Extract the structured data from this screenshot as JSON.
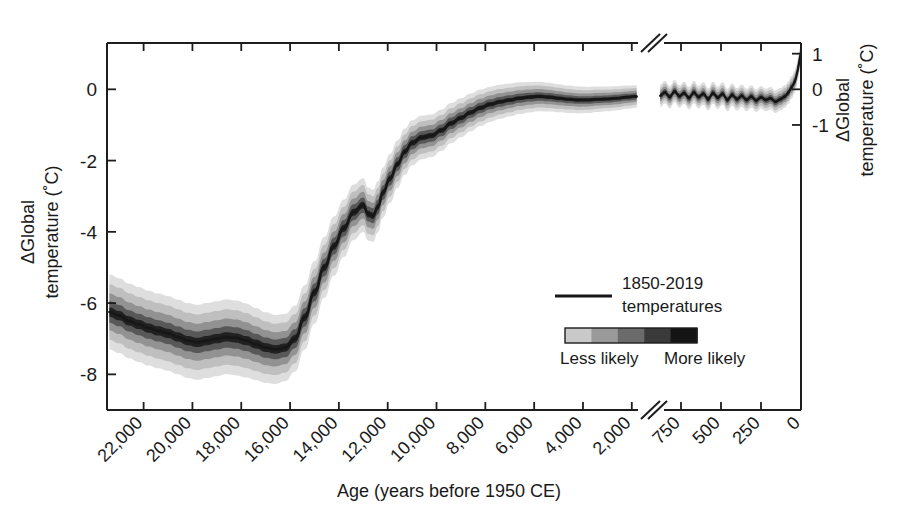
{
  "figure": {
    "type": "paleoclimate-temperature-reconstruction",
    "background": "#ffffff"
  },
  "axes": {
    "x": {
      "title": "Age (years before 1950 CE)",
      "tick_labels_paleo": [
        "22,000",
        "20,000",
        "18,000",
        "16,000",
        "14,000",
        "12,000",
        "10,000",
        "8,000",
        "6,000",
        "4,000",
        "2,000"
      ],
      "tick_values_paleo": [
        22000,
        20000,
        18000,
        16000,
        14000,
        12000,
        10000,
        8000,
        6000,
        4000,
        2000
      ],
      "tick_labels_instrumental": [
        "750",
        "500",
        "250",
        "0"
      ],
      "tick_values_instrumental": [
        750,
        500,
        250,
        0
      ],
      "label_rotation_deg": -45,
      "has_axis_break": true,
      "break_note": "double-slash break between 2,000 and 750 years BP",
      "range_paleo": [
        23500,
        1500
      ],
      "range_instrumental": [
        900,
        0
      ]
    },
    "y_left": {
      "title_line1": "ΔGlobal",
      "title_line2": "temperature (˚C)",
      "tick_labels": [
        "0",
        "-2",
        "-4",
        "-6",
        "-8"
      ],
      "tick_values": [
        0,
        -2,
        -4,
        -6,
        -8
      ],
      "ylim": [
        -9.0,
        1.3
      ]
    },
    "y_right": {
      "title_line1": "ΔGlobal",
      "title_line2": "temperature (˚C)",
      "tick_labels": [
        "1",
        "0",
        "-1"
      ],
      "tick_values": [
        1,
        0,
        -1
      ]
    }
  },
  "legend": {
    "line_label_line1": "1850-2019",
    "line_label_line2": "temperatures",
    "colorbar_left_label": "Less likely",
    "colorbar_right_label": "More likely",
    "colorbar_steps": [
      "#c9c9c9",
      "#9a9a9a",
      "#6b6b6b",
      "#3a3a3a",
      "#141414"
    ]
  },
  "colors": {
    "line": "#171717",
    "band_light": "#d8d8d8",
    "band_mid": "#a8a8a8",
    "band_dark": "#6e6e6e",
    "band_core": "#2e2e2e",
    "axis": "#1d1d1d"
  },
  "chart_data": {
    "type": "line",
    "title": "",
    "xlabel": "Age (years before 1950 CE)",
    "ylabel": "ΔGlobal temperature (˚C)",
    "ylim": [
      -9.0,
      1.3
    ],
    "xlim_paleo": [
      23500,
      1500
    ],
    "xlim_instrumental": [
      900,
      0
    ],
    "grid": false,
    "legend_position": "inside-lower-right",
    "x_axis_reversed": true,
    "series": [
      {
        "name": "Paleoclimate reconstruction (median)",
        "x_units": "years before 1950 CE",
        "x": [
          23400,
          23000,
          22600,
          22200,
          21800,
          21400,
          21000,
          20600,
          20200,
          19800,
          19400,
          19000,
          18600,
          18200,
          17800,
          17400,
          17000,
          16600,
          16200,
          15800,
          15400,
          15000,
          14600,
          14200,
          13800,
          13400,
          13000,
          12800,
          12600,
          12400,
          12200,
          11900,
          11600,
          11300,
          11000,
          10600,
          10200,
          9800,
          9400,
          9000,
          8600,
          8200,
          7800,
          7400,
          7000,
          6600,
          6200,
          5800,
          5400,
          5000,
          4600,
          4200,
          3800,
          3400,
          3000,
          2600,
          2200,
          1800
        ],
        "values": [
          -6.25,
          -6.35,
          -6.5,
          -6.6,
          -6.7,
          -6.78,
          -6.85,
          -6.95,
          -7.05,
          -7.1,
          -7.05,
          -7.0,
          -6.95,
          -6.98,
          -7.05,
          -7.15,
          -7.25,
          -7.3,
          -7.25,
          -7.0,
          -6.4,
          -5.7,
          -5.0,
          -4.4,
          -3.9,
          -3.45,
          -3.25,
          -3.5,
          -3.55,
          -3.3,
          -2.9,
          -2.5,
          -2.1,
          -1.75,
          -1.5,
          -1.35,
          -1.3,
          -1.15,
          -0.95,
          -0.8,
          -0.65,
          -0.52,
          -0.42,
          -0.35,
          -0.3,
          -0.25,
          -0.22,
          -0.2,
          -0.22,
          -0.25,
          -0.28,
          -0.3,
          -0.3,
          -0.28,
          -0.27,
          -0.25,
          -0.22,
          -0.2
        ]
      },
      {
        "name": "1850-2019 temperatures",
        "x_units": "years before 1950 CE",
        "x": [
          880,
          850,
          820,
          790,
          760,
          730,
          700,
          670,
          640,
          610,
          580,
          550,
          520,
          490,
          460,
          430,
          400,
          370,
          340,
          310,
          280,
          250,
          220,
          190,
          160,
          130,
          100,
          80,
          60,
          40,
          30,
          20,
          10,
          0
        ],
        "values": [
          -0.18,
          -0.08,
          -0.22,
          -0.05,
          -0.2,
          -0.1,
          -0.25,
          -0.08,
          -0.22,
          -0.12,
          -0.28,
          -0.1,
          -0.24,
          -0.12,
          -0.3,
          -0.15,
          -0.28,
          -0.18,
          -0.3,
          -0.2,
          -0.32,
          -0.22,
          -0.3,
          -0.25,
          -0.35,
          -0.28,
          -0.2,
          -0.1,
          0.05,
          0.2,
          0.35,
          0.55,
          0.8,
          1.05
        ]
      }
    ],
    "uncertainty_bands": {
      "description": "Probability-density shading around paleoclimate median; darker = more likely",
      "levels": [
        {
          "name": "widest",
          "half_width": 1.05,
          "color": "#dcdcdc"
        },
        {
          "name": "wide",
          "half_width": 0.78,
          "color": "#bdbdbd"
        },
        {
          "name": "mid",
          "half_width": 0.52,
          "color": "#8f8f8f"
        },
        {
          "name": "narrow",
          "half_width": 0.3,
          "color": "#555555"
        },
        {
          "name": "core",
          "half_width": 0.13,
          "color": "#1f1f1f"
        }
      ],
      "width_scale_note": "bands widest at glacial maximum (~1.0 C), narrowing to ~0.25 C in late Holocene"
    }
  }
}
